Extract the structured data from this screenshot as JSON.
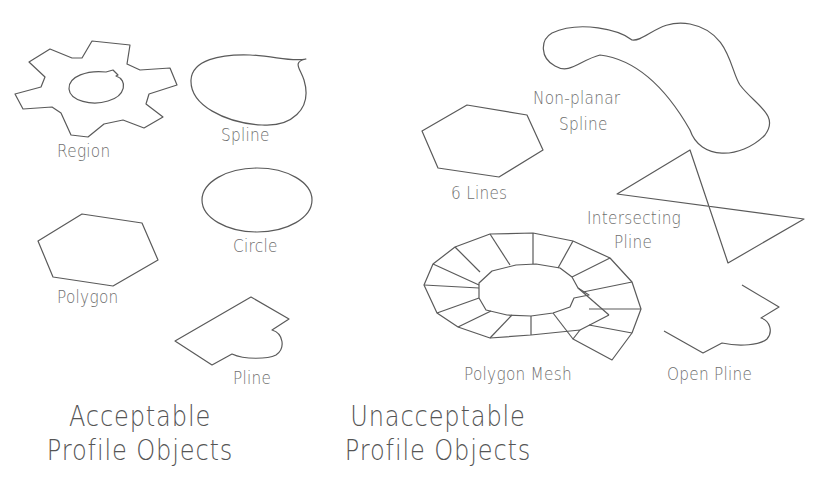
{
  "acceptable": {
    "heading_line1": "Acceptable",
    "heading_line2": "Profile Objects",
    "items": [
      {
        "label": "Region",
        "shape": "gear-with-keyed-hole"
      },
      {
        "label": "Spline",
        "shape": "closed-teardrop-spline"
      },
      {
        "label": "Circle",
        "shape": "circle-in-isometric-view"
      },
      {
        "label": "Polygon",
        "shape": "hexagon"
      },
      {
        "label": "Pline",
        "shape": "closed-polyline-with-arc"
      }
    ]
  },
  "unacceptable": {
    "heading_line1": "Unacceptable",
    "heading_line2": "Profile Objects",
    "items": [
      {
        "label_line1": "Non-planar",
        "label_line2": "Spline",
        "shape": "twisted-spline"
      },
      {
        "label": "6 Lines",
        "shape": "hexagon-of-separate-lines"
      },
      {
        "label_line1": "Intersecting",
        "label_line2": "Pline",
        "shape": "bowtie-polyline"
      },
      {
        "label": "Polygon Mesh",
        "shape": "ring-mesh"
      },
      {
        "label": "Open Pline",
        "shape": "open-polyline-with-arc"
      }
    ]
  },
  "colors": {
    "stroke": "#5a5a5a",
    "text": "#6e6e6e",
    "background": "#ffffff"
  }
}
